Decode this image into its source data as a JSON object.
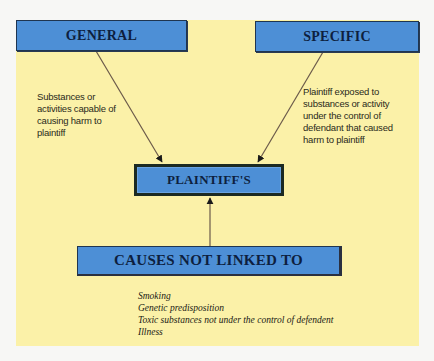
{
  "diagram": {
    "nodes": {
      "general": {
        "label": "GENERAL",
        "description": "Substances or activities capable of causing harm to plaintiff"
      },
      "specific": {
        "label": "SPECIFIC",
        "description": "Plaintiff exposed to substances or activity under the control of defendant that caused harm to plaintiff"
      },
      "plaintiff": {
        "label": "PLAINTIFF'S"
      },
      "causes": {
        "label": "CAUSES NOT LINKED TO",
        "items": [
          "Smoking",
          "Genetic predisposition",
          "Toxic substances not under the control of defendent",
          "Illness"
        ]
      }
    },
    "edges": [
      {
        "from": "general",
        "to": "plaintiff"
      },
      {
        "from": "specific",
        "to": "plaintiff"
      },
      {
        "from": "causes",
        "to": "plaintiff"
      }
    ],
    "colors": {
      "panel": "#fbf1a8",
      "box_fill": "#4d8fd6",
      "box_text": "#0d1f3f",
      "arrow": "#6b5a4a"
    }
  }
}
